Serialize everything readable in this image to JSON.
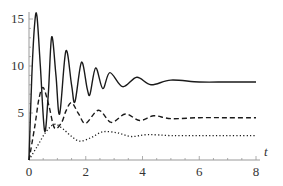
{
  "chart_data": {
    "type": "line",
    "title": "",
    "xlabel": "t",
    "ylabel": "",
    "xlim": [
      0,
      8
    ],
    "ylim": [
      0,
      16
    ],
    "x_ticks": [
      0,
      2,
      4,
      6,
      8
    ],
    "y_ticks": [
      5,
      10,
      15
    ],
    "grid": false,
    "legend": "none",
    "series": [
      {
        "name": "solid",
        "style": "solid",
        "color": "#1a1a1a",
        "x": [
          0,
          0.1,
          0.2,
          0.28,
          0.4,
          0.55,
          0.68,
          0.8,
          0.95,
          1.08,
          1.3,
          1.5,
          1.62,
          1.85,
          2.05,
          2.15,
          2.35,
          2.6,
          2.85,
          3.3,
          3.8,
          4.3,
          5.0,
          6.0,
          7.0,
          8.0
        ],
        "y": [
          0,
          9.0,
          14.5,
          15.3,
          10.0,
          3.1,
          7.0,
          13.1,
          9.0,
          4.9,
          11.6,
          8.0,
          6.2,
          10.4,
          7.6,
          7.0,
          9.8,
          7.6,
          9.3,
          7.8,
          8.8,
          8.0,
          8.5,
          8.3,
          8.3,
          8.3
        ]
      },
      {
        "name": "dashed",
        "style": "dashed",
        "color": "#1a1a1a",
        "x": [
          0,
          0.2,
          0.35,
          0.5,
          0.7,
          0.9,
          1.15,
          1.3,
          1.5,
          1.75,
          2.0,
          2.45,
          2.9,
          3.4,
          3.9,
          4.4,
          5.0,
          6.0,
          7.0,
          8.0
        ],
        "y": [
          0,
          3.5,
          6.5,
          7.7,
          5.8,
          3.4,
          4.0,
          5.2,
          6.1,
          4.9,
          3.9,
          5.3,
          4.0,
          4.9,
          4.2,
          4.7,
          4.4,
          4.5,
          4.5,
          4.5
        ]
      },
      {
        "name": "dotted",
        "style": "dotted",
        "color": "#1a1a1a",
        "x": [
          0,
          0.3,
          0.6,
          0.9,
          1.2,
          1.5,
          1.8,
          2.2,
          2.6,
          3.1,
          3.6,
          4.2,
          5.0,
          6.0,
          7.0,
          8.0
        ],
        "y": [
          0,
          1.5,
          3.0,
          3.8,
          3.3,
          2.5,
          2.0,
          2.4,
          3.0,
          2.9,
          2.5,
          2.7,
          2.6,
          2.6,
          2.6,
          2.6
        ]
      }
    ]
  }
}
